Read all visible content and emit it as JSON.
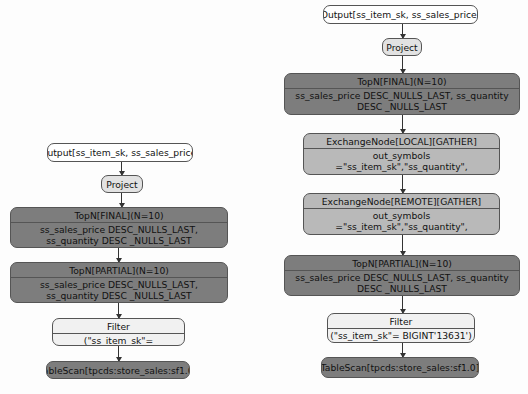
{
  "left_plan": {
    "output": "Output[ss_item_sk, ss_sales_price]",
    "project": "Project",
    "topn_final": {
      "title": "TopN[FINAL](N=10)",
      "body": "ss_sales_price DESC_NULLS_LAST, ss_quantity DESC _NULLS_LAST"
    },
    "topn_partial": {
      "title": "TopN[PARTIAL](N=10)",
      "body": "ss_sales_price DESC_NULLS_LAST, ss_quantity DESC _NULLS_LAST"
    },
    "filter": {
      "title": "Filter",
      "body": "(\"ss_item_sk\"= BIGINT'13631')"
    },
    "tablescan": "TableScan[tpcds:store_sales:sf1.0]"
  },
  "right_plan": {
    "output": "Output[ss_item_sk, ss_sales_price]",
    "project": "Project",
    "topn_final": {
      "title": "TopN[FINAL](N=10)",
      "body": "ss_sales_price DESC_NULLS_LAST, ss_quantity DESC _NULLS_LAST"
    },
    "exchange_local": {
      "title": "ExchangeNode[LOCAL][GATHER]",
      "body": "out_symbols =\"ss_item_sk\",\"ss_quantity\", \"ss_sales_price\""
    },
    "exchange_remote": {
      "title": "ExchangeNode[REMOTE][GATHER]",
      "body": "out_symbols =\"ss_item_sk\",\"ss_quantity\", \"ss_sales_price\""
    },
    "topn_partial": {
      "title": "TopN[PARTIAL](N=10)",
      "body": "ss_sales_price DESC_NULLS_LAST, ss_quantity DESC _NULLS_LAST"
    },
    "filter": {
      "title": "Filter",
      "body": "(\"ss_item_sk\"= BIGINT'13631')"
    },
    "tablescan": "TableScan[tpcds:store_sales:sf1.0]"
  },
  "colors": {
    "dark": "#7d7d7d",
    "mid": "#b9b9b9",
    "light": "#e2e2e2",
    "white": "#ffffff"
  }
}
